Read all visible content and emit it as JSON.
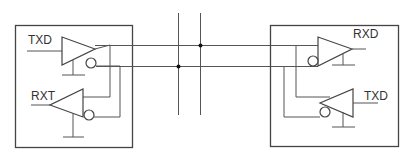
{
  "diagram": {
    "type": "differential transceiver bus",
    "left_node": {
      "driver_label": "TXD",
      "receiver_label": "RXT"
    },
    "right_node": {
      "receiver_label": "RXD",
      "driver_label": "TXD"
    },
    "bus": {
      "lines": [
        "upper",
        "lower"
      ],
      "taps": 2
    },
    "colors": {
      "line": "#555555",
      "box": "#444444",
      "background": "#ffffff"
    }
  }
}
